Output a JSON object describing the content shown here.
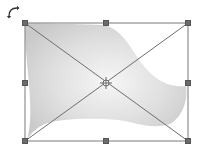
{
  "canvas": {
    "width": 199,
    "height": 147,
    "background": "#ffffff"
  },
  "selection": {
    "label": "Warped shape selection",
    "bounding_box": {
      "x1": 25,
      "y1": 23,
      "x2": 188,
      "y2": 141
    },
    "frame_color": "#7a7a7a",
    "handle_color": "#6b6b6b",
    "handles": [
      {
        "name": "top-left",
        "x": 25,
        "y": 23
      },
      {
        "name": "top-center",
        "x": 106,
        "y": 23
      },
      {
        "name": "top-right",
        "x": 188,
        "y": 23
      },
      {
        "name": "middle-left",
        "x": 25,
        "y": 83
      },
      {
        "name": "middle-right",
        "x": 188,
        "y": 83
      },
      {
        "name": "bottom-left",
        "x": 25,
        "y": 141
      },
      {
        "name": "bottom-center",
        "x": 106,
        "y": 141
      },
      {
        "name": "bottom-right",
        "x": 188,
        "y": 141
      }
    ],
    "center_point": {
      "x": 106,
      "y": 83,
      "icon": "crosshair-center-icon"
    },
    "rotate_icon": "rotate-arrow-icon"
  },
  "shape": {
    "type": "warped-flag",
    "fill_light": "#f6f6f6",
    "fill_dark": "#c9c9c9"
  }
}
